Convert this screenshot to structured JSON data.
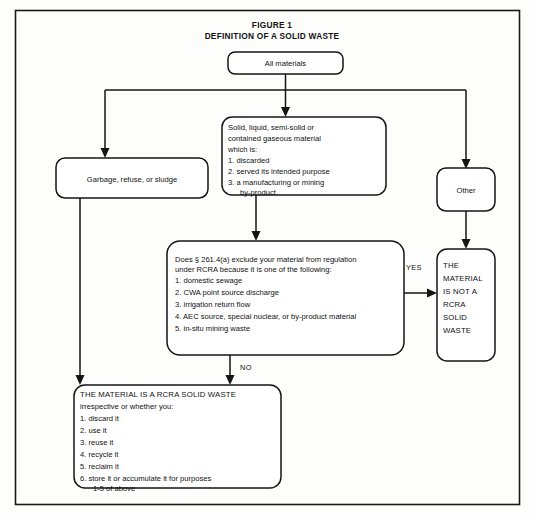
{
  "figure": {
    "title_line1": "FIGURE 1",
    "title_line2": "DEFINITION OF A SOLID WASTE"
  },
  "nodes": {
    "all_materials": {
      "label": "All materials"
    },
    "garbage": {
      "label": "Garbage, refuse, or sludge"
    },
    "other": {
      "label": "Other"
    },
    "solid_liquid": {
      "line1": "Solid, liquid, semi-solid or",
      "line2": "contained gaseous material",
      "line3": "which is:",
      "line4": "1.  discarded",
      "line5": "2.  served its intended purpose",
      "line6": "3.  a manufacturing or mining",
      "line7": "by-product"
    },
    "decision": {
      "line1": "Does  § 261.4(a) exclude your material from regulation",
      "line2": "under RCRA because it is one of the following:",
      "line3": "1.  domestic sewage",
      "line4": "2.  CWA point source discharge",
      "line5": "3.  irrigation return flow",
      "line6": "4.  AEC source, special nuclear, or by-product material",
      "line7": "5.  in-situ mining waste"
    },
    "not_waste": {
      "line1": "THE",
      "line2": "MATERIAL",
      "line3": "IS NOT A",
      "line4": "RCRA",
      "line5": "SOLID",
      "line6": "WASTE"
    },
    "is_waste": {
      "line1": "THE MATERIAL IS A RCRA SOLID WASTE",
      "line2": "irrespective or whether you:",
      "line3": "1.  discard it",
      "line4": "2.  use it",
      "line5": "3.  reuse it",
      "line6": "4.  recycle it",
      "line7": "5.  reclaim it",
      "line8": "6.  store it or accumulate it for purposes",
      "line9": "1-5 of above"
    }
  },
  "edges": {
    "yes_label": "YES",
    "no_label": "NO"
  },
  "colors": {
    "stroke": "#151515",
    "background": "#fdfdfc",
    "text": "#111111"
  }
}
